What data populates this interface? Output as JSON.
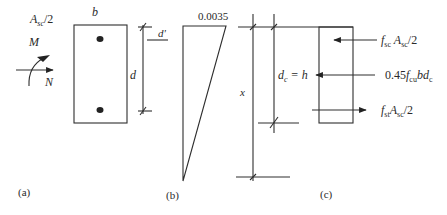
{
  "figure": {
    "panel_a": {
      "caption": "(a)",
      "label_asc": "A",
      "label_asc_sub": "sc",
      "label_asc_suffix": "/2",
      "label_b": "b",
      "label_d": "d",
      "label_dprime": "d'",
      "label_M": "M",
      "label_N": "N"
    },
    "panel_b": {
      "caption": "(b)",
      "strain_value": "0.0035"
    },
    "panel_c": {
      "caption": "(c)",
      "label_x": "x",
      "label_dc": "d",
      "label_dc_sub": "c",
      "label_dc_eq": " = h",
      "force_top": {
        "f": "f",
        "f_sub": "sc",
        "a": " A",
        "a_sub": "sc",
        "suffix": "/2"
      },
      "force_mid": {
        "prefix": "0.45",
        "f": "f",
        "f_sub": "cu",
        "suffix": "bd",
        "suffix_sub": "c"
      },
      "force_bot": {
        "f": "f",
        "f_sub": "st",
        "a": "A",
        "a_sub": "sc",
        "suffix": "/2"
      }
    }
  }
}
